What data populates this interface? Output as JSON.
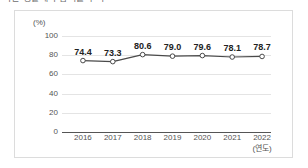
{
  "title": {
    "text": "국민 생활체육 참여율 추이"
  },
  "chart_data": {
    "type": "line",
    "title": "",
    "xlabel": "(연도)",
    "ylabel": "(%)",
    "categories": [
      "2016",
      "2017",
      "2018",
      "2019",
      "2020",
      "2021",
      "2022"
    ],
    "values": [
      74.4,
      73.3,
      80.6,
      79.0,
      79.6,
      78.1,
      78.7
    ],
    "value_labels": [
      "74.4",
      "73.3",
      "80.6",
      "79.0",
      "79.6",
      "78.1",
      "78.7"
    ],
    "ylim": [
      0,
      100
    ],
    "yticks": [
      0,
      20,
      40,
      60,
      80,
      100
    ],
    "ytick_labels": [
      "0",
      "20",
      "40",
      "60",
      "80",
      "100"
    ],
    "grid": true,
    "legend": false,
    "series": [
      {
        "name": "참여율",
        "values": [
          74.4,
          73.3,
          80.6,
          79.0,
          79.6,
          78.1,
          78.7
        ]
      }
    ]
  },
  "style": {
    "line_color": "#4a4a4a",
    "marker_fill": "#ffffff",
    "marker_stroke": "#4a4a4a",
    "grid_color": "#e4e4e4",
    "axis_color": "#555555",
    "border_color": "#dcdcdc",
    "background": "#ffffff",
    "label_color": "#222222",
    "tick_color": "#545454"
  }
}
